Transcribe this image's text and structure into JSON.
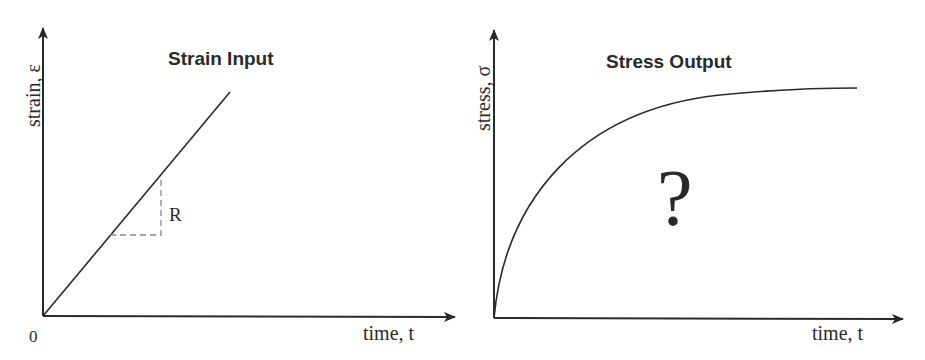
{
  "left_panel": {
    "title": "Strain Input",
    "y_axis_label": "strain, ε",
    "x_axis_label": "time, t",
    "origin_label": "0",
    "slope_label": "R",
    "curve": "linear ramp ε = R·t"
  },
  "right_panel": {
    "title": "Stress Output",
    "y_axis_label": "stress, σ",
    "x_axis_label": "time, t",
    "annotation": "?",
    "curve": "increasing, concave, saturating response"
  },
  "colors": {
    "line": "#2a2a2a",
    "dash": "#888888",
    "background": "#ffffff"
  }
}
